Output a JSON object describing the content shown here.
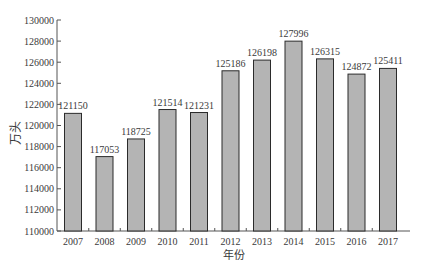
{
  "chart_data": {
    "type": "bar",
    "title": "",
    "xlabel": "年份",
    "ylabel": "万头",
    "categories": [
      "2007",
      "2008",
      "2009",
      "2010",
      "2011",
      "2012",
      "2013",
      "2014",
      "2015",
      "2016",
      "2017"
    ],
    "values": [
      121150,
      117053,
      118725,
      121514,
      121231,
      125186,
      126198,
      127996,
      126315,
      124872,
      125411
    ],
    "data_labels": [
      "121150",
      "117053",
      "118725",
      "121514",
      "121231",
      "125186",
      "126198",
      "127996",
      "126315",
      "124872",
      "125411"
    ],
    "ylim": [
      110000,
      130000
    ],
    "yticks": [
      110000,
      112000,
      114000,
      116000,
      118000,
      120000,
      122000,
      124000,
      126000,
      128000,
      130000
    ],
    "ytick_labels": [
      "110000",
      "112000",
      "114000",
      "116000",
      "118000",
      "120000",
      "122000",
      "124000",
      "126000",
      "128000",
      "130000"
    ],
    "grid": false,
    "legend": null,
    "colors": {
      "bar_fill": "#b4b4b4",
      "bar_stroke": "#2b2b2b",
      "axis": "#555555",
      "text": "#3a3a3a"
    }
  }
}
